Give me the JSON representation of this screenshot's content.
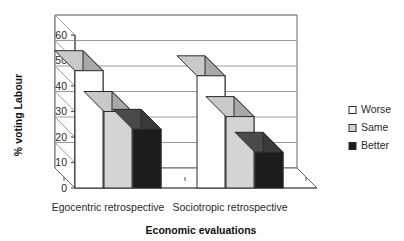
{
  "chart_data": {
    "type": "bar",
    "title": "",
    "subtitle": "",
    "xlabel": "Economic evaluations",
    "ylabel": "% voting Labour",
    "categories": [
      "Egocentric retrospective",
      "Sociotropic retrospective"
    ],
    "series": [
      {
        "name": "Worse",
        "values": [
          46,
          44
        ],
        "color": "#ffffff"
      },
      {
        "name": "Same",
        "values": [
          30,
          28
        ],
        "color": "#d4d4d4"
      },
      {
        "name": "Better",
        "values": [
          23,
          14
        ],
        "color": "#1c1c1c"
      }
    ],
    "ylim": [
      0,
      60
    ],
    "yticks": [
      0,
      10,
      20,
      30,
      40,
      50,
      60
    ],
    "ytick_labels": [
      "0",
      "10",
      "20",
      "30",
      "40",
      "50",
      "60"
    ],
    "grid": true,
    "grid_axis": "y",
    "legend_position": "right",
    "style": "3d-column",
    "render": {
      "plot_left": 75,
      "plot_right": 317,
      "baseline_y": 188,
      "top_y": 35,
      "depth_x": -20,
      "depth_y": -20,
      "bar_width": 28,
      "group_step": 122,
      "bar_step": 29,
      "group_origin": 75,
      "value_scale": 2.55
    }
  },
  "legend": {
    "items": [
      {
        "label": "Worse",
        "swatch": "#ffffff"
      },
      {
        "label": "Same",
        "swatch": "#d4d4d4"
      },
      {
        "label": "Better",
        "swatch": "#1c1c1c"
      }
    ]
  },
  "colors": {
    "axis": "#555555",
    "grid": "#9a9a9a",
    "frame": "#666666",
    "bar_side": "#a8a8a8",
    "bar_top": "#c9c9c9",
    "bar_side_dark": "#3a3a3a",
    "bar_top_dark": "#4a4a4a",
    "bar_outline": "#2a2a2a",
    "text": "#2a2a2a",
    "background": "#ffffff"
  }
}
